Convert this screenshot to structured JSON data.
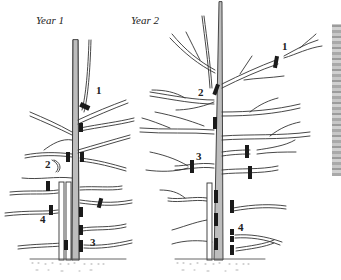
{
  "panels": [
    {
      "label": "Year 1",
      "markers": [
        {
          "num": "1",
          "x": 96,
          "y": 90
        },
        {
          "num": "2",
          "x": 45,
          "y": 164
        },
        {
          "num": "3",
          "x": 90,
          "y": 243
        },
        {
          "num": "4",
          "x": 40,
          "y": 219
        }
      ]
    },
    {
      "label": "Year 2",
      "markers": [
        {
          "num": "1",
          "x": 282,
          "y": 46
        },
        {
          "num": "2",
          "x": 198,
          "y": 92
        },
        {
          "num": "3",
          "x": 196,
          "y": 157
        },
        {
          "num": "4",
          "x": 238,
          "y": 227
        }
      ]
    }
  ],
  "colors": {
    "ink": "#222222",
    "trunk": "#b9b9b9",
    "cut_mark": "#1a1a1a",
    "texture": "#a0a0a0"
  }
}
